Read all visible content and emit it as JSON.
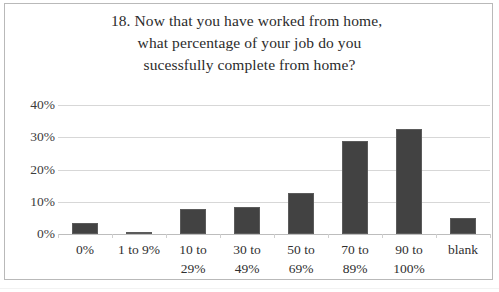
{
  "chart_data": {
    "type": "bar",
    "title": "18. Now that you have worked from home, what percentage of your job do you sucessfully complete from home?",
    "title_lines": [
      "18. Now that you have worked from home,",
      "what percentage of your job do you",
      "sucessfully complete from home?"
    ],
    "categories": [
      "0%",
      "1 to 9%",
      "10 to 29%",
      "30 to 49%",
      "50 to 69%",
      "70 to 89%",
      "90 to 100%",
      "blank"
    ],
    "category_lines": [
      [
        "0%",
        ""
      ],
      [
        "1 to 9%",
        ""
      ],
      [
        "10 to",
        "29%"
      ],
      [
        "30 to",
        "49%"
      ],
      [
        "50 to",
        "69%"
      ],
      [
        "70 to",
        "89%"
      ],
      [
        "90 to",
        "100%"
      ],
      [
        "blank",
        ""
      ]
    ],
    "values": [
      3.4,
      0.6,
      7.8,
      8.4,
      12.8,
      28.8,
      32.5,
      5.0
    ],
    "xlabel": "",
    "ylabel": "",
    "ylim": [
      0,
      40
    ],
    "ytick_values": [
      0,
      10,
      20,
      30,
      40
    ],
    "ytick_labels": [
      "0%",
      "10%",
      "20%",
      "30%",
      "40%"
    ],
    "grid": true,
    "legend": false,
    "bar_color": "#424242",
    "gridline_color": "#d7d7d7",
    "text_color": "#2f2f2f",
    "background": "#ffffff",
    "border_color": "#b9b9b9"
  }
}
